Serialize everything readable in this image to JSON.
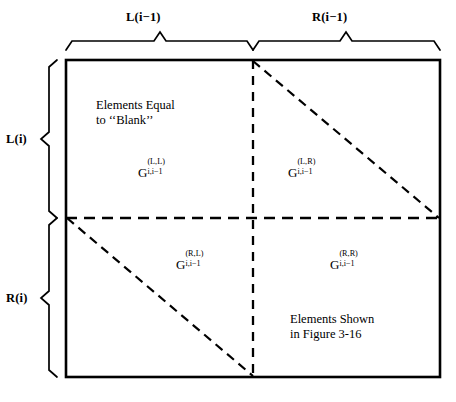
{
  "figure": {
    "type": "partition-diagram",
    "title_text": "",
    "background_color": "#ffffff",
    "line_color": "#000000"
  },
  "top_brackets": [
    {
      "label": "L(i−1)",
      "name": "bracket-top-left",
      "span": "left half"
    },
    {
      "label": "R(i−1)",
      "name": "bracket-top-right",
      "span": "right half"
    }
  ],
  "left_brackets": [
    {
      "label": "L(i)",
      "name": "bracket-left-top",
      "span": "top half"
    },
    {
      "label": "R(i)",
      "name": "bracket-left-bottom",
      "span": "bottom half"
    }
  ],
  "quadrants": {
    "top_left": {
      "symbol_base": "G",
      "superscript": "(L,L)",
      "subscript": "i,i−1",
      "note_lines": [
        "Elements Equal",
        "to ‘‘Blank’’"
      ]
    },
    "top_right": {
      "symbol_base": "G",
      "superscript": "(L,R)",
      "subscript": "i,i−1",
      "note_lines": []
    },
    "bottom_left": {
      "symbol_base": "G",
      "superscript": "(R,L)",
      "subscript": "i,i−1",
      "note_lines": []
    },
    "bottom_right": {
      "symbol_base": "G",
      "superscript": "(R,R)",
      "subscript": "i,i−1",
      "note_lines": [
        "Elements Shown",
        "in Figure 3-16"
      ]
    }
  }
}
